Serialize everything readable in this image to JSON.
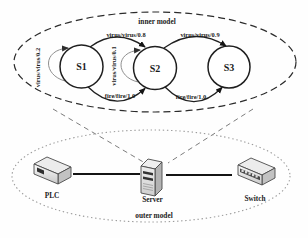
{
  "figure": {
    "inner_model": {
      "title": "inner model",
      "states": [
        {
          "label": "S1"
        },
        {
          "label": "S2"
        },
        {
          "label": "S3"
        }
      ],
      "transitions": {
        "s1_s2_virus": "virus/virus/0.8",
        "s2_s3_virus": "virus/virus/0.9",
        "s1_s2_fire": "fire/fire/1.0",
        "s2_s3_fire": "fire/fire/1.0",
        "s1_self": "virus/virus/0.2",
        "s2_self": "virus/virus/0.1"
      }
    },
    "outer_model": {
      "title": "outer model",
      "devices": [
        {
          "label": "PLC"
        },
        {
          "label": "Server"
        },
        {
          "label": "Switch"
        }
      ]
    },
    "colors": {
      "line": "#1f1f1f",
      "loop_line": "#8f8f8f",
      "outer_ellipse": "#9c9c9c",
      "projection_line": "#7d7d7d"
    }
  }
}
